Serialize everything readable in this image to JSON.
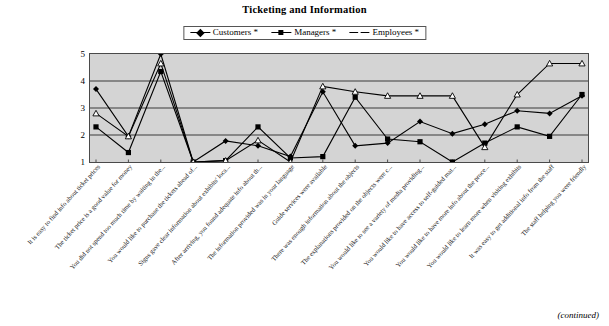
{
  "chart_data": {
    "type": "line",
    "title": "Ticketing and Information",
    "xlabel": "",
    "ylabel": "",
    "ylim": [
      1,
      5
    ],
    "yticks": [
      1,
      2,
      3,
      4,
      5
    ],
    "grid": true,
    "legend_position": "top-center",
    "categories": [
      "It is easy to find info about ticket prices",
      "The ticket price is a good value for money",
      "You did not spend too much time by waiting in the...",
      "You would like to purchase the tickets ahead of...",
      "Signs gave clear information about exhibits' loca...",
      "After arriving, you found adequate info about th...",
      "The information provided was in your language",
      "Guide services were available",
      "There was enough information about the objects",
      "The explanations provided on the objects were c...",
      "You would like to see a variety of media providing...",
      "You would like to have access to self-guided mat...",
      "You would like to have more info about the proce...",
      "You would like to learn more when visiting exhibits",
      "It was easy to get additional info from the staff",
      "The staff helping you were friendly"
    ],
    "series": [
      {
        "name": "Customers *",
        "marker": "filled-diamond",
        "color": "#000000",
        "values": [
          3.7,
          1.95,
          5.0,
          1.0,
          1.78,
          1.6,
          1.2,
          3.6,
          1.6,
          1.7,
          2.5,
          2.05,
          2.4,
          2.9,
          2.8,
          3.45
        ]
      },
      {
        "name": "Managers *",
        "marker": "filled-square",
        "color": "#000000",
        "values": [
          2.3,
          1.35,
          4.35,
          1.0,
          1.05,
          2.3,
          1.15,
          1.2,
          3.4,
          1.85,
          1.75,
          1.0,
          1.7,
          2.3,
          1.95,
          3.5
        ]
      },
      {
        "name": "Employees *",
        "marker": "open-triangle",
        "color": "#000000",
        "values": [
          2.8,
          1.95,
          4.65,
          1.0,
          1.05,
          1.8,
          1.0,
          3.8,
          3.6,
          3.45,
          3.45,
          3.45,
          1.55,
          3.5,
          4.65,
          4.65
        ]
      }
    ],
    "footnote": "(continued)"
  },
  "legend": {
    "items": [
      {
        "label": "Customers *"
      },
      {
        "label": "Managers *"
      },
      {
        "label": "Employees *"
      }
    ]
  },
  "axis": {
    "yticks": [
      "5",
      "4",
      "3",
      "2",
      "1"
    ]
  }
}
